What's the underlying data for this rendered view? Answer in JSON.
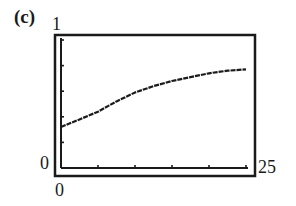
{
  "panel": {
    "label": "(c)"
  },
  "axes": {
    "y_max_label": "1",
    "y_min_label": "0",
    "x_min_label": "0",
    "x_max_label": "25"
  },
  "colors": {
    "line": "#1a1a1a",
    "frame": "#1a1a1a",
    "background": "#ffffff"
  },
  "chart_data": {
    "type": "line",
    "title": "(c)",
    "xlabel": "",
    "ylabel": "",
    "xlim": [
      0,
      25
    ],
    "ylim": [
      0,
      1
    ],
    "x_ticks": [
      0,
      5,
      10,
      15,
      20,
      25
    ],
    "y_ticks": [
      0,
      0.2,
      0.4,
      0.6,
      0.8,
      1
    ],
    "tick_labels": {
      "x": [
        "0",
        "25"
      ],
      "y": [
        "0",
        "1"
      ]
    },
    "grid": false,
    "legend": null,
    "series": [
      {
        "name": "curve",
        "x": [
          0,
          2.5,
          5,
          7.5,
          10,
          12.5,
          15,
          17.5,
          20,
          22.5,
          25
        ],
        "y": [
          0.32,
          0.38,
          0.44,
          0.52,
          0.59,
          0.64,
          0.68,
          0.71,
          0.74,
          0.76,
          0.77
        ]
      }
    ]
  }
}
